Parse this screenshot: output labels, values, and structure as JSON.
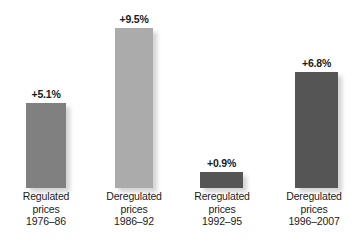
{
  "chart_data": {
    "type": "bar",
    "title": "",
    "subtitle": "",
    "xlabel": "",
    "ylabel": "",
    "ylim": [
      0,
      11.2
    ],
    "grid": false,
    "legend": false,
    "categories": [
      "Regulated prices 1976–86",
      "Deregulated prices 1986–92",
      "Reregulated prices 1992–95",
      "Deregulated prices 1996–2007"
    ],
    "values": [
      5.1,
      9.5,
      0.9,
      6.8
    ],
    "value_labels": [
      "+5.1%",
      "+9.5%",
      "+0.9%",
      "+6.8%"
    ],
    "bar_colors": [
      "#808080",
      "#ababab",
      "#555555",
      "#555555"
    ]
  },
  "bars": [
    {
      "value_label": "+5.1%",
      "color": "#808080",
      "left": 26,
      "width": 40,
      "height": 85,
      "label_left": 8,
      "label_width": 76,
      "label_lines": [
        "Regulated",
        "prices",
        "1976–86"
      ]
    },
    {
      "value_label": "+9.5%",
      "color": "#ababab",
      "left": 115,
      "width": 38,
      "height": 160,
      "label_left": 96,
      "label_width": 76,
      "label_lines": [
        "Deregulated",
        "prices",
        "1986–92"
      ]
    },
    {
      "value_label": "+0.9%",
      "color": "#555555",
      "left": 200,
      "width": 43,
      "height": 16,
      "label_left": 183,
      "label_width": 78,
      "label_lines": [
        "Reregulated",
        "prices",
        "1992–95"
      ]
    },
    {
      "value_label": "+6.8%",
      "color": "#555555",
      "left": 295,
      "width": 43,
      "height": 116,
      "label_left": 272,
      "label_width": 84,
      "label_lines": [
        "Deregulated",
        "prices",
        "1996–2007"
      ]
    }
  ]
}
